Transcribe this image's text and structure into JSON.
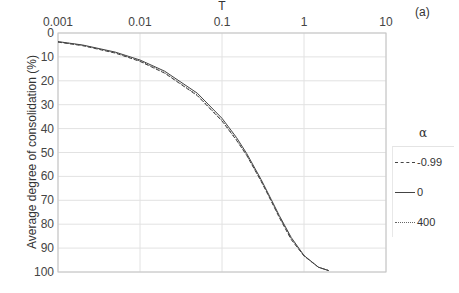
{
  "chart_data": {
    "type": "line",
    "title": "",
    "panel_label": "(a)",
    "xlabel": "T",
    "ylabel": "Average degree of consolidation (%)",
    "x_scale": "log",
    "x_axis_position": "top",
    "xlim": [
      0.001,
      10
    ],
    "ylim": [
      0,
      100
    ],
    "y_inverted": true,
    "x_ticks": [
      "0.001",
      "0.01",
      "0.1",
      "1",
      "10"
    ],
    "y_ticks": [
      "0",
      "10",
      "20",
      "30",
      "40",
      "50",
      "60",
      "70",
      "80",
      "90",
      "100"
    ],
    "grid": true,
    "legend_position": "right",
    "legend_title": "α",
    "x": [
      0.001,
      0.002,
      0.005,
      0.01,
      0.02,
      0.05,
      0.1,
      0.15,
      0.2,
      0.3,
      0.4,
      0.5,
      0.7,
      1.0,
      1.5,
      2.0
    ],
    "series": [
      {
        "name": "-0.99",
        "style": "dashed",
        "values": [
          3.8,
          5.3,
          8.4,
          11.9,
          16.8,
          26.2,
          36.8,
          44.8,
          51.2,
          62.0,
          70.5,
          77.2,
          86.5,
          93.3,
          98.0,
          99.4
        ]
      },
      {
        "name": "0",
        "style": "solid",
        "values": [
          3.6,
          5.0,
          8.0,
          11.3,
          16.0,
          25.2,
          35.7,
          43.7,
          50.4,
          61.3,
          69.8,
          76.4,
          85.6,
          93.1,
          98.0,
          99.4
        ]
      },
      {
        "name": "400",
        "style": "dotted",
        "values": [
          3.7,
          5.2,
          8.3,
          11.7,
          16.6,
          26.0,
          36.6,
          44.6,
          51.1,
          61.9,
          70.3,
          77.0,
          86.2,
          93.2,
          98.0,
          99.4
        ]
      }
    ]
  },
  "legend": {
    "title": "α",
    "items": [
      {
        "label": "-0.99",
        "style": "dashed"
      },
      {
        "label": "0",
        "style": "solid"
      },
      {
        "label": "400",
        "style": "dotted"
      }
    ]
  },
  "colors": {
    "line": "#444444",
    "grid": "#e2e2e2",
    "axis": "#bdbdbd"
  }
}
